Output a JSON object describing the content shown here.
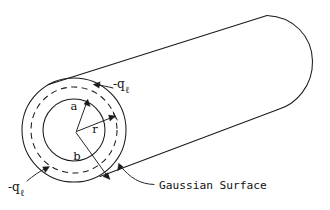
{
  "figure": {
    "stroke_color": "#1a1a1a",
    "background_color": "#ffffff",
    "labels": {
      "inner_radius": "a",
      "outer_radius": "b",
      "gaussian_radius": "r",
      "outer_charge": "-q",
      "outer_charge_sub": "ℓ",
      "inner_charge": "-q",
      "inner_charge_sub": "ℓ",
      "gaussian_surface": "Gaussian Surface"
    },
    "geometry": {
      "center_x": 74,
      "center_y": 130,
      "outer_radius_px": 52,
      "gaussian_radius_px": 43,
      "inner_radius_px": 31
    }
  }
}
